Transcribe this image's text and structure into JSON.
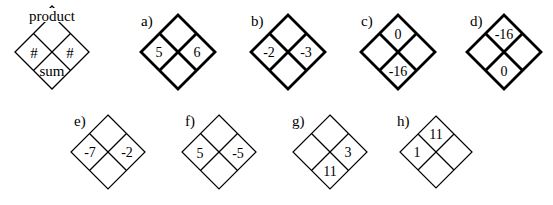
{
  "key": {
    "top": "product",
    "left": "#",
    "right": "#",
    "bottom": "sum"
  },
  "problems": [
    {
      "label": "a)",
      "top": "",
      "left": "5",
      "right": "6",
      "bottom": ""
    },
    {
      "label": "b)",
      "top": "",
      "left": "-2",
      "right": "-3",
      "bottom": ""
    },
    {
      "label": "c)",
      "top": "0",
      "left": "",
      "right": "",
      "bottom": "-16"
    },
    {
      "label": "d)",
      "top": "-16",
      "left": "",
      "right": "",
      "bottom": "0"
    },
    {
      "label": "e)",
      "top": "",
      "left": "-7",
      "right": "-2",
      "bottom": ""
    },
    {
      "label": "f)",
      "top": "",
      "left": "5",
      "right": "-5",
      "bottom": ""
    },
    {
      "label": "g)",
      "top": "",
      "left": "",
      "right": "3",
      "bottom": "11"
    },
    {
      "label": "h)",
      "top": "11",
      "left": "1",
      "right": "",
      "bottom": ""
    }
  ],
  "colors": {
    "stroke": "#000000",
    "background": "#ffffff"
  }
}
